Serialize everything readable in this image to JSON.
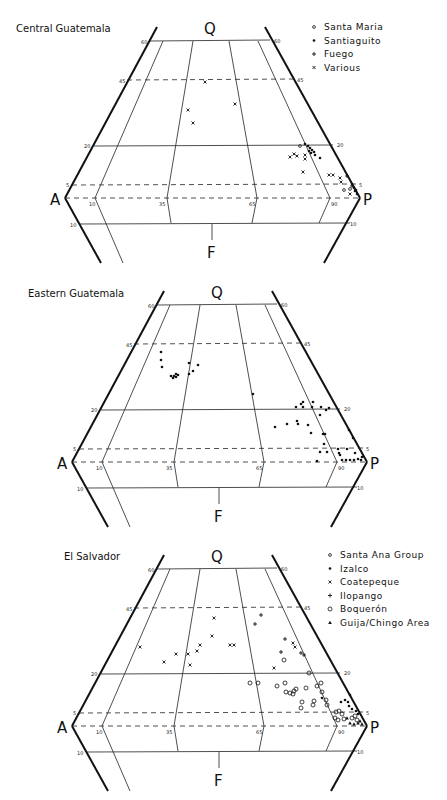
{
  "figure": {
    "panels": [
      {
        "id": "central-guatemala",
        "title": "Central Guatemala",
        "offset": [
          0,
          0
        ],
        "title_pos": [
          16,
          32
        ],
        "legend_pos": [
          310,
          30
        ],
        "legend": [
          {
            "symbol": "open-circle-small",
            "label": "Santa Maria"
          },
          {
            "symbol": "dot",
            "label": "Santiaguito"
          },
          {
            "symbol": "plus",
            "label": "Fuego"
          },
          {
            "symbol": "cross",
            "label": "Various"
          }
        ],
        "points": [
          {
            "s": "cross",
            "x": 205,
            "y": 82
          },
          {
            "s": "cross",
            "x": 188,
            "y": 110
          },
          {
            "s": "cross",
            "x": 235,
            "y": 104
          },
          {
            "s": "cross",
            "x": 193,
            "y": 123
          },
          {
            "s": "dot",
            "x": 305,
            "y": 144
          },
          {
            "s": "dot",
            "x": 308,
            "y": 146
          },
          {
            "s": "dot",
            "x": 310,
            "y": 148
          },
          {
            "s": "dot",
            "x": 312,
            "y": 150
          },
          {
            "s": "dot",
            "x": 309,
            "y": 151
          },
          {
            "s": "dot",
            "x": 314,
            "y": 152
          },
          {
            "s": "dot",
            "x": 311,
            "y": 153
          },
          {
            "s": "dot",
            "x": 315,
            "y": 155
          },
          {
            "s": "dot",
            "x": 320,
            "y": 158
          },
          {
            "s": "open-circle-small",
            "x": 300,
            "y": 146
          },
          {
            "s": "open-circle-small",
            "x": 344,
            "y": 190
          },
          {
            "s": "open-circle-small",
            "x": 350,
            "y": 189
          },
          {
            "s": "cross",
            "x": 290,
            "y": 157
          },
          {
            "s": "cross",
            "x": 294,
            "y": 154
          },
          {
            "s": "cross",
            "x": 297,
            "y": 156
          },
          {
            "s": "cross",
            "x": 305,
            "y": 155
          },
          {
            "s": "cross",
            "x": 305,
            "y": 159
          },
          {
            "s": "cross",
            "x": 303,
            "y": 172
          },
          {
            "s": "cross",
            "x": 329,
            "y": 175
          },
          {
            "s": "cross",
            "x": 333,
            "y": 175
          },
          {
            "s": "cross",
            "x": 340,
            "y": 178
          },
          {
            "s": "cross",
            "x": 341,
            "y": 182
          },
          {
            "s": "cross",
            "x": 350,
            "y": 194
          },
          {
            "s": "plus",
            "x": 347,
            "y": 176
          },
          {
            "s": "plus",
            "x": 352,
            "y": 186
          },
          {
            "s": "dot",
            "x": 352,
            "y": 184
          },
          {
            "s": "dot",
            "x": 354,
            "y": 188
          },
          {
            "s": "dot",
            "x": 355,
            "y": 191
          },
          {
            "s": "dot",
            "x": 357,
            "y": 194
          },
          {
            "s": "dot",
            "x": 356,
            "y": 190
          }
        ]
      },
      {
        "id": "eastern-guatemala",
        "title": "Eastern Guatemala",
        "offset": [
          7,
          264
        ],
        "title_pos": [
          28,
          297
        ],
        "legend_pos": null,
        "legend": [],
        "points": [
          {
            "s": "dot",
            "x": 161,
            "y": 352
          },
          {
            "s": "dot",
            "x": 161,
            "y": 360
          },
          {
            "s": "dot",
            "x": 162,
            "y": 367
          },
          {
            "s": "dot",
            "x": 171,
            "y": 376
          },
          {
            "s": "dot",
            "x": 174,
            "y": 376
          },
          {
            "s": "dot",
            "x": 176,
            "y": 377
          },
          {
            "s": "dot",
            "x": 178,
            "y": 375
          },
          {
            "s": "dot",
            "x": 176,
            "y": 374
          },
          {
            "s": "dot",
            "x": 173,
            "y": 378
          },
          {
            "s": "dot",
            "x": 189,
            "y": 363
          },
          {
            "s": "dot",
            "x": 193,
            "y": 371
          },
          {
            "s": "dot",
            "x": 198,
            "y": 365
          },
          {
            "s": "dot",
            "x": 189,
            "y": 374
          },
          {
            "s": "dot",
            "x": 253,
            "y": 394
          },
          {
            "s": "dot",
            "x": 296,
            "y": 407
          },
          {
            "s": "dot",
            "x": 301,
            "y": 404
          },
          {
            "s": "dot",
            "x": 303,
            "y": 402
          },
          {
            "s": "dot",
            "x": 303,
            "y": 407
          },
          {
            "s": "dot",
            "x": 313,
            "y": 402
          },
          {
            "s": "dot",
            "x": 312,
            "y": 407
          },
          {
            "s": "dot",
            "x": 321,
            "y": 407
          },
          {
            "s": "dot",
            "x": 326,
            "y": 410
          },
          {
            "s": "dot",
            "x": 329,
            "y": 408
          },
          {
            "s": "dot",
            "x": 320,
            "y": 415
          },
          {
            "s": "dot",
            "x": 275,
            "y": 427
          },
          {
            "s": "dot",
            "x": 287,
            "y": 424
          },
          {
            "s": "dot",
            "x": 297,
            "y": 421
          },
          {
            "s": "dot",
            "x": 298,
            "y": 424
          },
          {
            "s": "dot",
            "x": 308,
            "y": 425
          },
          {
            "s": "dot",
            "x": 311,
            "y": 433
          },
          {
            "s": "dot",
            "x": 323,
            "y": 434
          },
          {
            "s": "dot",
            "x": 325,
            "y": 434
          },
          {
            "s": "dot",
            "x": 324,
            "y": 444
          },
          {
            "s": "dot",
            "x": 320,
            "y": 452
          },
          {
            "s": "dot",
            "x": 327,
            "y": 452
          },
          {
            "s": "dot",
            "x": 317,
            "y": 461
          },
          {
            "s": "dot",
            "x": 338,
            "y": 449
          },
          {
            "s": "dot",
            "x": 339,
            "y": 453
          },
          {
            "s": "dot",
            "x": 340,
            "y": 455
          },
          {
            "s": "dot",
            "x": 347,
            "y": 449
          },
          {
            "s": "dot",
            "x": 349,
            "y": 430
          },
          {
            "s": "dot",
            "x": 353,
            "y": 438
          },
          {
            "s": "dot",
            "x": 355,
            "y": 453
          },
          {
            "s": "dot",
            "x": 342,
            "y": 460
          },
          {
            "s": "dot",
            "x": 346,
            "y": 460
          },
          {
            "s": "dot",
            "x": 350,
            "y": 460
          },
          {
            "s": "dot",
            "x": 354,
            "y": 460
          },
          {
            "s": "dot",
            "x": 358,
            "y": 459
          },
          {
            "s": "dot",
            "x": 361,
            "y": 460
          },
          {
            "s": "dot",
            "x": 362,
            "y": 457
          }
        ]
      },
      {
        "id": "el-salvador",
        "title": "El Salvador",
        "offset": [
          7,
          528
        ],
        "title_pos": [
          64,
          560
        ],
        "legend_pos": [
          326,
          558
        ],
        "legend": [
          {
            "symbol": "open-circle-small",
            "label": "Santa Ana Group"
          },
          {
            "symbol": "dot",
            "label": "Izalco"
          },
          {
            "symbol": "cross",
            "label": "Coatepeque"
          },
          {
            "symbol": "plus",
            "label": "Ilopango"
          },
          {
            "symbol": "open-circle",
            "label": "Boquerón"
          },
          {
            "symbol": "triangle",
            "label": "Guija/Chingo Area"
          }
        ],
        "points": [
          {
            "s": "cross",
            "x": 140,
            "y": 647
          },
          {
            "s": "cross",
            "x": 164,
            "y": 662
          },
          {
            "s": "cross",
            "x": 176,
            "y": 654
          },
          {
            "s": "cross",
            "x": 188,
            "y": 654
          },
          {
            "s": "cross",
            "x": 190,
            "y": 665
          },
          {
            "s": "cross",
            "x": 197,
            "y": 651
          },
          {
            "s": "cross",
            "x": 200,
            "y": 645
          },
          {
            "s": "cross",
            "x": 212,
            "y": 636
          },
          {
            "s": "cross",
            "x": 214,
            "y": 618
          },
          {
            "s": "cross",
            "x": 230,
            "y": 645
          },
          {
            "s": "cross",
            "x": 234,
            "y": 645
          },
          {
            "s": "cross",
            "x": 274,
            "y": 668
          },
          {
            "s": "plus",
            "x": 261,
            "y": 615
          },
          {
            "s": "plus",
            "x": 255,
            "y": 624
          },
          {
            "s": "plus",
            "x": 285,
            "y": 639
          },
          {
            "s": "plus",
            "x": 281,
            "y": 652
          },
          {
            "s": "plus",
            "x": 301,
            "y": 653
          },
          {
            "s": "plus",
            "x": 304,
            "y": 655
          },
          {
            "s": "cross",
            "x": 293,
            "y": 643
          },
          {
            "s": "cross",
            "x": 295,
            "y": 647
          },
          {
            "s": "open-circle",
            "x": 284,
            "y": 660
          },
          {
            "s": "open-circle",
            "x": 309,
            "y": 673
          },
          {
            "s": "open-circle",
            "x": 250,
            "y": 683
          },
          {
            "s": "open-circle",
            "x": 258,
            "y": 683
          },
          {
            "s": "open-circle",
            "x": 277,
            "y": 686
          },
          {
            "s": "open-circle",
            "x": 285,
            "y": 683
          },
          {
            "s": "open-circle",
            "x": 286,
            "y": 692
          },
          {
            "s": "open-circle",
            "x": 290,
            "y": 693
          },
          {
            "s": "open-circle",
            "x": 293,
            "y": 694
          },
          {
            "s": "open-circle",
            "x": 294,
            "y": 691
          },
          {
            "s": "open-circle",
            "x": 296,
            "y": 689
          },
          {
            "s": "open-circle",
            "x": 306,
            "y": 688
          },
          {
            "s": "open-circle",
            "x": 317,
            "y": 686
          },
          {
            "s": "open-circle",
            "x": 321,
            "y": 683
          },
          {
            "s": "open-circle",
            "x": 322,
            "y": 692
          },
          {
            "s": "open-circle",
            "x": 326,
            "y": 700
          },
          {
            "s": "open-circle",
            "x": 327,
            "y": 705
          },
          {
            "s": "open-circle",
            "x": 302,
            "y": 702
          },
          {
            "s": "open-circle",
            "x": 301,
            "y": 708
          },
          {
            "s": "open-circle",
            "x": 314,
            "y": 701
          },
          {
            "s": "open-circle",
            "x": 313,
            "y": 705
          },
          {
            "s": "open-circle",
            "x": 336,
            "y": 712
          },
          {
            "s": "open-circle",
            "x": 339,
            "y": 711
          },
          {
            "s": "open-circle",
            "x": 342,
            "y": 714
          },
          {
            "s": "open-circle",
            "x": 335,
            "y": 718
          },
          {
            "s": "open-circle",
            "x": 338,
            "y": 720
          },
          {
            "s": "open-circle",
            "x": 344,
            "y": 719
          },
          {
            "s": "open-circle",
            "x": 352,
            "y": 718
          },
          {
            "s": "open-circle",
            "x": 355,
            "y": 716
          },
          {
            "s": "open-circle",
            "x": 357,
            "y": 720
          },
          {
            "s": "dot",
            "x": 322,
            "y": 698
          },
          {
            "s": "dot",
            "x": 341,
            "y": 702
          },
          {
            "s": "dot",
            "x": 345,
            "y": 700
          },
          {
            "s": "dot",
            "x": 348,
            "y": 702
          },
          {
            "s": "dot",
            "x": 349,
            "y": 706
          },
          {
            "s": "dot",
            "x": 350,
            "y": 695
          },
          {
            "s": "dot",
            "x": 352,
            "y": 709
          },
          {
            "s": "dot",
            "x": 356,
            "y": 711
          },
          {
            "s": "dot",
            "x": 358,
            "y": 714
          },
          {
            "s": "triangle",
            "x": 350,
            "y": 723
          },
          {
            "s": "triangle",
            "x": 354,
            "y": 724
          },
          {
            "s": "triangle",
            "x": 358,
            "y": 723
          },
          {
            "s": "triangle",
            "x": 360,
            "y": 721
          },
          {
            "s": "triangle",
            "x": 362,
            "y": 724
          },
          {
            "s": "triangle",
            "x": 347,
            "y": 718
          }
        ]
      }
    ],
    "vertex_labels": {
      "top": "Q",
      "left": "A",
      "right": "P",
      "bottom": "F"
    },
    "tick_labels": {
      "q60": "60",
      "q45": "45",
      "q20": "20",
      "q5": "5",
      "a10": "10",
      "a35": "35",
      "a65": "65",
      "a90": "90",
      "f10": "10"
    }
  }
}
